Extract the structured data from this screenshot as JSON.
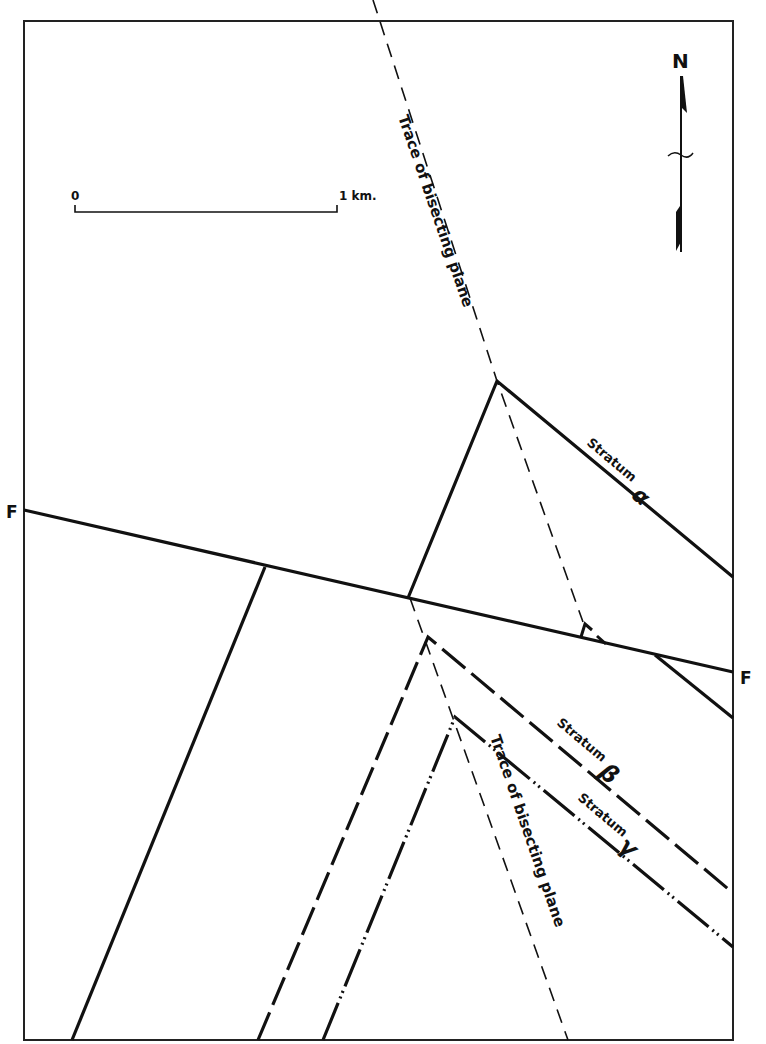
{
  "figure": {
    "type": "geologic-map-diagram",
    "frame": {
      "x1": 24,
      "y1": 21,
      "x2": 733,
      "y2": 1040
    },
    "north_arrow": {
      "label": "N"
    },
    "scale_bar": {
      "start_label": "0",
      "end_label": "1 km."
    },
    "fault": {
      "label_left": "F",
      "label_right": "F"
    },
    "strata": [
      {
        "name": "Stratum",
        "symbol": "α",
        "line_style": "solid"
      },
      {
        "name": "Stratum",
        "symbol": "β",
        "line_style": "long-dash"
      },
      {
        "name": "Stratum",
        "symbol": "γ",
        "line_style": "dash-dot-dot"
      }
    ],
    "traces": [
      {
        "label": "Trace of bisecting plane",
        "position": "upper"
      },
      {
        "label": "Trace of bisecting plane",
        "position": "lower"
      }
    ]
  },
  "colors": {
    "ink": "#111111",
    "paper": "#ffffff"
  }
}
